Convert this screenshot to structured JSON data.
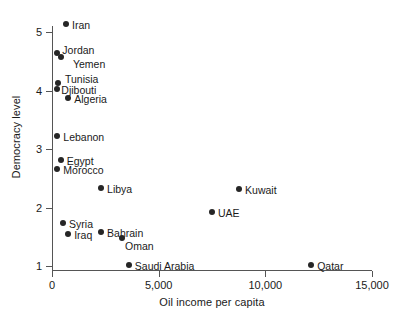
{
  "chart_data": {
    "type": "scatter",
    "title": "",
    "xlabel": "Oil income per capita",
    "ylabel": "Democracy level",
    "xlim": [
      0,
      15000
    ],
    "ylim": [
      0.78,
      5.35
    ],
    "grid": false,
    "legend": null,
    "xticks": [
      {
        "value": 0,
        "label": "0"
      },
      {
        "value": 5000,
        "label": "5,000"
      },
      {
        "value": 10000,
        "label": "10,000"
      },
      {
        "value": 15000,
        "label": "15,000"
      }
    ],
    "yticks": [
      {
        "value": 1,
        "label": "1"
      },
      {
        "value": 2,
        "label": "2"
      },
      {
        "value": 3,
        "label": "3"
      },
      {
        "value": 4,
        "label": "4"
      },
      {
        "value": 5,
        "label": "5"
      }
    ],
    "points": [
      {
        "name": "Iran",
        "x": 660,
        "y": 5.14,
        "label_dx": 6,
        "label_dy": -5
      },
      {
        "name": "Jordan",
        "x": 250,
        "y": 4.64,
        "label_dx": 5,
        "label_dy": -9
      },
      {
        "name": "Yemen",
        "x": 420,
        "y": 4.58,
        "label_dx": 12,
        "label_dy": 1
      },
      {
        "name": "Tunisia",
        "x": 280,
        "y": 4.12,
        "label_dx": 7,
        "label_dy": -10
      },
      {
        "name": "Djibouti",
        "x": 250,
        "y": 4.03,
        "label_dx": 4,
        "label_dy": 0
      },
      {
        "name": "Algeria",
        "x": 760,
        "y": 3.88,
        "label_dx": 6,
        "label_dy": -5
      },
      {
        "name": "Lebanon",
        "x": 250,
        "y": 3.22,
        "label_dx": 6,
        "label_dy": -5
      },
      {
        "name": "Egypt",
        "x": 410,
        "y": 2.81,
        "label_dx": 6,
        "label_dy": -5
      },
      {
        "name": "Morocco",
        "x": 250,
        "y": 2.66,
        "label_dx": 6,
        "label_dy": -5
      },
      {
        "name": "Libya",
        "x": 2300,
        "y": 2.33,
        "label_dx": 6,
        "label_dy": -5
      },
      {
        "name": "Kuwait",
        "x": 8770,
        "y": 2.32,
        "label_dx": 6,
        "label_dy": -5
      },
      {
        "name": "UAE",
        "x": 7500,
        "y": 1.92,
        "label_dx": 6,
        "label_dy": -5
      },
      {
        "name": "Syria",
        "x": 520,
        "y": 1.73,
        "label_dx": 6,
        "label_dy": -5
      },
      {
        "name": "Bahrain",
        "x": 2300,
        "y": 1.58,
        "label_dx": 6,
        "label_dy": -5
      },
      {
        "name": "Iraq",
        "x": 760,
        "y": 1.55,
        "label_dx": 6,
        "label_dy": -5
      },
      {
        "name": "Oman",
        "x": 3280,
        "y": 1.48,
        "label_dx": 3,
        "label_dy": 2
      },
      {
        "name": "Saudi Arabia",
        "x": 3600,
        "y": 1.02,
        "label_dx": 6,
        "label_dy": -5
      },
      {
        "name": "Qatar",
        "x": 12150,
        "y": 1.02,
        "label_dx": 6,
        "label_dy": -5
      }
    ],
    "colors": {
      "marker": "#262626",
      "axis": "#555555",
      "text": "#1a1a1a",
      "background": "#ffffff"
    }
  }
}
